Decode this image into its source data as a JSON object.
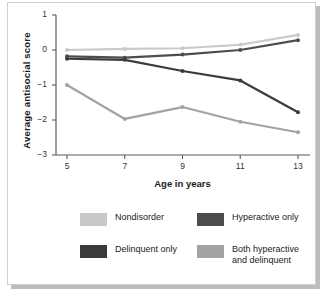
{
  "chart_data": {
    "type": "line",
    "title": "",
    "xlabel": "Age in years",
    "ylabel": "Average antisocial  score",
    "x": [
      5,
      7,
      9,
      11,
      13
    ],
    "xticklabels": [
      "5",
      "7",
      "9",
      "11",
      "13"
    ],
    "yticklabels": [
      "1",
      "0",
      "−1",
      "−2",
      "−3"
    ],
    "ytickvalues": [
      1,
      0,
      -1,
      -2,
      -3
    ],
    "ylim": [
      -3,
      1
    ],
    "xlim": [
      5,
      13
    ],
    "grid": false,
    "legend_position": "below-plot",
    "series": [
      {
        "name": "Nondisorder",
        "color": "#c9c9c9",
        "values": [
          0.0,
          0.03,
          0.05,
          0.15,
          0.43
        ]
      },
      {
        "name": "Hyperactive only",
        "color": "#4d4d4d",
        "values": [
          -0.18,
          -0.22,
          -0.13,
          0.0,
          0.28
        ]
      },
      {
        "name": "Delinquent only",
        "color": "#3b3b3b",
        "values": [
          -0.25,
          -0.28,
          -0.6,
          -0.87,
          -1.78
        ]
      },
      {
        "name": "Both hyperactive\nand delinquent",
        "color": "#a3a3a3",
        "values": [
          -1.0,
          -1.97,
          -1.63,
          -2.05,
          -2.35
        ]
      }
    ]
  },
  "axes": {
    "y_title": "Average antisocial  score",
    "x_title": "Age in years",
    "y_ticks": [
      "1",
      "0",
      "−1",
      "−2",
      "−3"
    ],
    "x_ticks": [
      "5",
      "7",
      "9",
      "11",
      "13"
    ]
  },
  "legend": {
    "items": [
      {
        "label": "Nondisorder",
        "color": "#c9c9c9"
      },
      {
        "label": "Hyperactive only",
        "color": "#4d4d4d"
      },
      {
        "label": "Delinquent only",
        "color": "#3b3b3b"
      },
      {
        "label": "Both hyperactive\nand delinquent",
        "color": "#a3a3a3"
      }
    ]
  },
  "colors": {
    "axis": "#5a5a5a",
    "text": "#1a1a1a",
    "background": "#ffffff",
    "frame": "#cfcfcf"
  }
}
